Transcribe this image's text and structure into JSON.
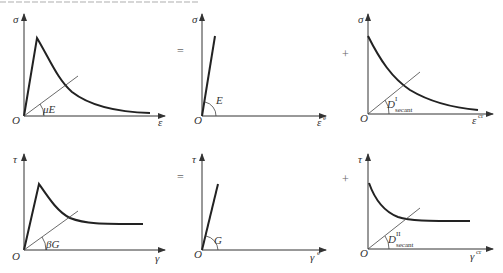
{
  "diagram": {
    "type": "stress-strain decomposition",
    "rows": [
      {
        "name": "normal",
        "panels": [
          {
            "id": "total",
            "y_label": "σ",
            "x_label": "ε",
            "origin": "O",
            "secant_label": "μE",
            "curve": "peak then decay"
          },
          {
            "id": "elastic",
            "operator_before": "=",
            "y_label": "σ",
            "x_label": "ε",
            "x_sup": "e",
            "origin": "O",
            "slope_label": "E",
            "curve": "linear"
          },
          {
            "id": "crack",
            "operator_before": "+",
            "y_label": "σ",
            "x_label": "ε",
            "x_sup": "cr",
            "origin": "O",
            "secant_label": "D",
            "secant_sup": "I",
            "secant_sub": "secant",
            "curve": "decay"
          }
        ]
      },
      {
        "name": "shear",
        "panels": [
          {
            "id": "total",
            "y_label": "τ",
            "x_label": "γ",
            "origin": "O",
            "secant_label": "βG",
            "curve": "peak then plateau"
          },
          {
            "id": "elastic",
            "operator_before": "=",
            "y_label": "τ",
            "x_label": "γ",
            "x_sup": "e",
            "origin": "O",
            "slope_label": "G",
            "curve": "linear"
          },
          {
            "id": "crack",
            "operator_before": "+",
            "y_label": "τ",
            "x_label": "γ",
            "x_sup": "cr",
            "origin": "O",
            "secant_label": "D",
            "secant_sup": "II",
            "secant_sub": "secant",
            "curve": "decay to plateau"
          }
        ]
      }
    ]
  }
}
